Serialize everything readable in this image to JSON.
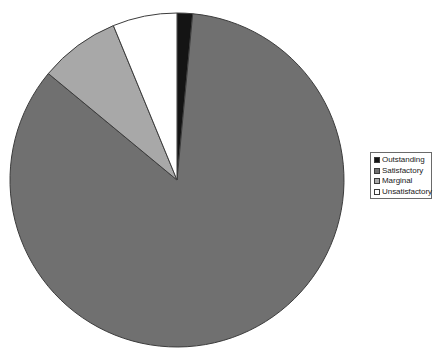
{
  "chart_data": {
    "type": "pie",
    "title": "",
    "subtitle": "",
    "xlabel": "",
    "ylabel": "",
    "grid": false,
    "legend_position": "right",
    "start_angle_deg": 0,
    "direction": "clockwise",
    "center": {
      "x": 177,
      "y": 180
    },
    "radius": 167,
    "categories": [
      "Outstanding",
      "Satisfactory",
      "Marginal",
      "Unsatisfactory"
    ],
    "values": [
      1.5,
      84.5,
      7.8,
      6.2
    ],
    "units": "percent",
    "colors": [
      "#141414",
      "#707070",
      "#a8a8a8",
      "#ffffff"
    ],
    "slices": [
      {
        "label": "Outstanding",
        "value": 1.5,
        "color": "#141414",
        "start_deg": 0,
        "end_deg": 5.4
      },
      {
        "label": "Satisfactory",
        "value": 84.5,
        "color": "#707070",
        "start_deg": 5.4,
        "end_deg": 309.6
      },
      {
        "label": "Marginal",
        "value": 7.8,
        "color": "#a8a8a8",
        "start_deg": 309.6,
        "end_deg": 337.6
      },
      {
        "label": "Unsatisfactory",
        "value": 6.2,
        "color": "#ffffff",
        "start_deg": 337.6,
        "end_deg": 360
      }
    ]
  },
  "legend": {
    "border_color": "#6a6a6a",
    "items": [
      {
        "label": "Outstanding",
        "color": "#141414"
      },
      {
        "label": "Satisfactory",
        "color": "#707070"
      },
      {
        "label": "Marginal",
        "color": "#a8a8a8"
      },
      {
        "label": "Unsatisfactory",
        "color": "#ffffff"
      }
    ]
  },
  "style": {
    "background": "#ffffff",
    "slice_outline": "#3c3c3c"
  }
}
